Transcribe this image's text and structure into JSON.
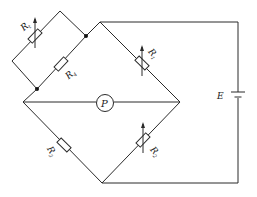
{
  "diagram": {
    "type": "wheatstone-bridge-circuit",
    "line_color": "#2a2a2a",
    "background": "#ffffff",
    "components": {
      "rt": {
        "symbol": "R",
        "subscript": "t",
        "kind": "variable-resistor"
      },
      "r4": {
        "symbol": "R",
        "subscript": "4",
        "kind": "resistor"
      },
      "r1": {
        "symbol": "R",
        "subscript": "1",
        "kind": "variable-resistor"
      },
      "r3": {
        "symbol": "R",
        "subscript": "3",
        "kind": "resistor"
      },
      "r2": {
        "symbol": "R",
        "subscript": "2",
        "kind": "variable-resistor"
      },
      "meter": {
        "symbol": "P",
        "kind": "galvanometer"
      },
      "source": {
        "symbol": "E",
        "kind": "battery"
      }
    }
  }
}
